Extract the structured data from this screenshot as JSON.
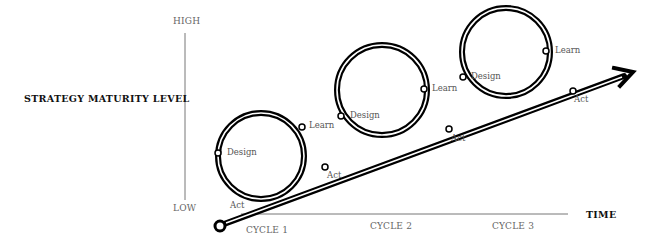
{
  "diagram": {
    "y_axis": {
      "title": "STRATEGY MATURITY LEVEL",
      "high_label": "HIGH",
      "low_label": "LOW"
    },
    "x_axis": {
      "title": "TIME",
      "cycles": [
        "CYCLE 1",
        "CYCLE 2",
        "CYCLE 3"
      ]
    },
    "start_node_label": "Act",
    "loops": [
      {
        "cycle": "CYCLE 1",
        "design_label": "Design",
        "learn_label": "Learn",
        "act_label": "Act"
      },
      {
        "cycle": "CYCLE 2",
        "design_label": "Design",
        "learn_label": "Learn",
        "act_label": "Act"
      },
      {
        "cycle": "CYCLE 3",
        "design_label": "Design",
        "learn_label": "Learn",
        "act_label": "Act"
      }
    ],
    "colors": {
      "line": "#000000",
      "text": "#555555",
      "title": "#111111",
      "axis": "#666666"
    }
  }
}
